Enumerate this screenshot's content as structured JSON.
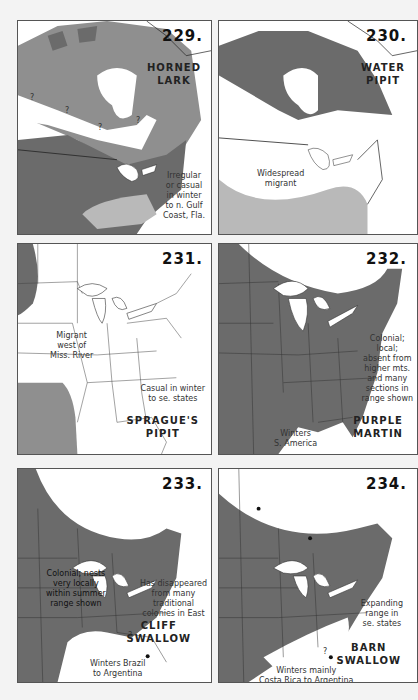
{
  "colors": {
    "page_bg": "#f3f3f3",
    "panel_bg": "#ffffff",
    "range_dark": "#6b6b6b",
    "range_medium": "#8f8f8f",
    "range_light": "#b9b9b9",
    "border": "#555555"
  },
  "maps": [
    {
      "number": "229.",
      "species_line1": "HORNED",
      "species_line2": "LARK",
      "notes": [
        "Irregular",
        "or casual",
        "in winter",
        "to n. Gulf",
        "Coast, Fla."
      ],
      "question_marks": [
        "?",
        "?",
        "?",
        "?"
      ]
    },
    {
      "number": "230.",
      "species_line1": "WATER",
      "species_line2": "PIPIT",
      "notes": [
        "Widespread",
        "migrant"
      ]
    },
    {
      "number": "231.",
      "species_line1": "SPRAGUE'S",
      "species_line2": "PIPIT",
      "notes_left": [
        "Migrant",
        "west of",
        "Miss. River"
      ],
      "notes_right": [
        "Casual in winter",
        "to se. states"
      ]
    },
    {
      "number": "232.",
      "species_line1": "PURPLE",
      "species_line2": "MARTIN",
      "notes_right": [
        "Colonial;",
        "local;",
        "absent from",
        "higher mts.",
        "and many",
        "sections in",
        "range shown"
      ],
      "notes_bottom": [
        "Winters",
        "S. America"
      ]
    },
    {
      "number": "233.",
      "species_line1": "CLIFF",
      "species_line2": "SWALLOW",
      "notes_left": [
        "Colonial; nests",
        "very locally",
        "within summer",
        "range shown"
      ],
      "notes_right": [
        "Has disappeared",
        "from many",
        "traditional",
        "colonies in East"
      ],
      "notes_bottom": [
        "Winters Brazil",
        "to Argentina"
      ],
      "question_marks": [
        "?"
      ]
    },
    {
      "number": "234.",
      "species_line1": "BARN",
      "species_line2": "SWALLOW",
      "notes_right": [
        "Expanding",
        "range in",
        "se. states"
      ],
      "notes_bottom": [
        "Winters mainly",
        "Costa Rica to Argentina"
      ],
      "question_marks": [
        "?"
      ]
    }
  ]
}
